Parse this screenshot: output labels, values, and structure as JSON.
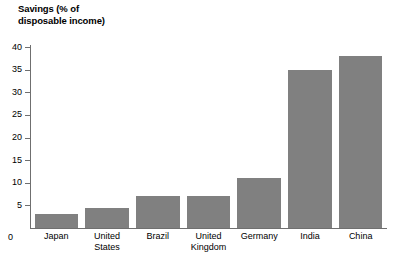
{
  "chart_data": {
    "type": "bar",
    "title": "Savings (% of\ndisposable income)",
    "xlabel": "",
    "ylabel": "",
    "categories": [
      "Japan",
      "United\nStates",
      "Brazil",
      "United\nKingdom",
      "Germany",
      "India",
      "China"
    ],
    "values": [
      3,
      4.5,
      7,
      7,
      11,
      35,
      38
    ],
    "ylim": [
      0,
      40
    ],
    "yticks": [
      0,
      5,
      10,
      15,
      20,
      25,
      30,
      35,
      40
    ],
    "ytick_labels": [
      "0",
      "5",
      "10",
      "15",
      "20",
      "25",
      "30",
      "35",
      "40"
    ],
    "grid": false,
    "legend": null,
    "bar_color": "#808080",
    "axis_color": "#6f6f6f",
    "background": "#ffffff"
  }
}
